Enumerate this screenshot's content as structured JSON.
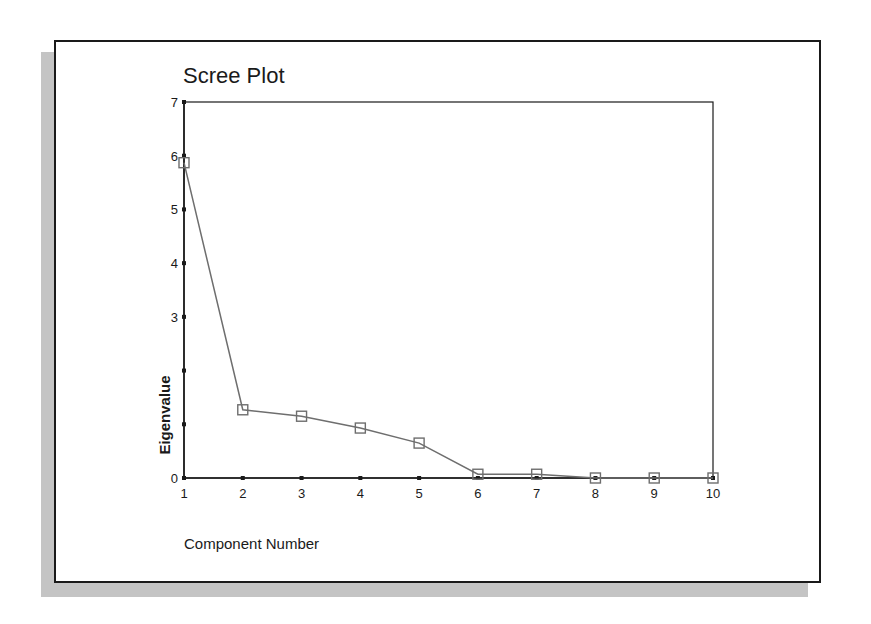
{
  "chart_data": {
    "type": "line",
    "title": "Scree Plot",
    "xlabel": "Component Number",
    "ylabel": "Eigenvalue",
    "x": [
      1,
      2,
      3,
      4,
      5,
      6,
      7,
      8,
      9,
      10
    ],
    "categories": [
      "1",
      "2",
      "3",
      "4",
      "5",
      "6",
      "7",
      "8",
      "9",
      "10"
    ],
    "series": [
      {
        "name": "Eigenvalue",
        "values": [
          5.87,
          1.27,
          1.15,
          0.93,
          0.65,
          0.07,
          0.07,
          0.0,
          0.0,
          0.0
        ]
      }
    ],
    "yticks": [
      "0",
      "1",
      "2",
      "3",
      "4",
      "5",
      "6",
      "7"
    ],
    "ytick_labels_visible": [
      "0",
      "3",
      "4",
      "5",
      "6",
      "7"
    ],
    "ylim": [
      0,
      7
    ],
    "xlim": [
      1,
      10
    ],
    "grid": false,
    "legend": null,
    "marker": "square"
  },
  "colors": {
    "line": "#6e6e6e",
    "marker": "#6e6e6e",
    "axis": "#1a1a1a",
    "shadow": "#c4c4c4"
  }
}
